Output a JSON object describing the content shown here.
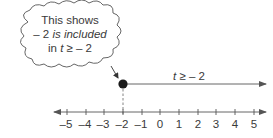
{
  "callout": {
    "line1": "This shows",
    "line2_prefix": "– 2 ",
    "line2_italic": "is included",
    "line3_prefix": "in ",
    "line3_var": "t",
    "line3_suffix": " ≥ – 2"
  },
  "ray": {
    "label_var": "t",
    "label_suffix": " ≥ – 2",
    "start_value": -2,
    "endpoint": "closed-dot",
    "direction": "right"
  },
  "number_line": {
    "ticks": [
      "–5",
      "–4",
      "–3",
      "–2",
      "–1",
      "0",
      "1",
      "2",
      "3",
      "4",
      "5"
    ],
    "marked_value": "–2"
  },
  "colors": {
    "line": "#555555",
    "text": "#3a3a3a",
    "dot": "#1a1a1a"
  }
}
